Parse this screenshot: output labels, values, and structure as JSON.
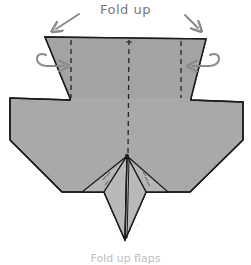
{
  "diagram": {
    "type": "origami-fold-instruction",
    "instruction": "Fold up",
    "caption": "Fold up flaps",
    "colors": {
      "paper": "#a9a9a9",
      "paper_light": "#b9b9b9",
      "paper_dark_left": "#9a9a9a",
      "outline": "#1a1a1a",
      "arrow": "#8a8a8a",
      "text": "#777777"
    },
    "annotations": [
      {
        "name": "left-diagonal-arrow",
        "direction": "down-left"
      },
      {
        "name": "right-diagonal-arrow",
        "direction": "down-right"
      },
      {
        "name": "left-curl-arrow",
        "meaning": "fold behind"
      },
      {
        "name": "right-curl-arrow",
        "meaning": "fold behind"
      }
    ],
    "fold_lines": [
      "left-valley-fold",
      "center-crease",
      "right-valley-fold"
    ]
  }
}
